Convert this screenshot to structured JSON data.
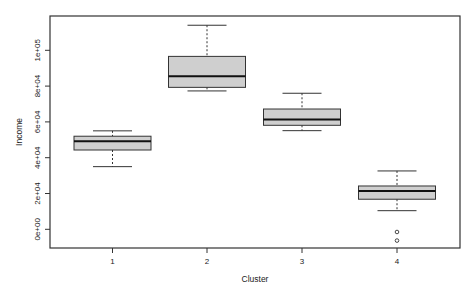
{
  "chart_data": {
    "type": "boxplot",
    "title": "",
    "xlabel": "Cluster",
    "ylabel": "Income",
    "categories": [
      "1",
      "2",
      "3",
      "4"
    ],
    "y_ticks": [
      {
        "value": 0,
        "label": "0e+00"
      },
      {
        "value": 20000,
        "label": "2e+04"
      },
      {
        "value": 40000,
        "label": "4e+04"
      },
      {
        "value": 60000,
        "label": "6e+04"
      },
      {
        "value": 80000,
        "label": "8e+04"
      },
      {
        "value": 100000,
        "label": "1e+05"
      }
    ],
    "ylim": [
      -10000,
      129000
    ],
    "grid": false,
    "legend": null,
    "box_fill": "#cfcfcf",
    "series": [
      {
        "name": "1",
        "lower_whisker": 35000,
        "q1": 44300,
        "median": 49200,
        "q3": 52000,
        "upper_whisker": 55000,
        "outliers": []
      },
      {
        "name": "2",
        "lower_whisker": 77300,
        "q1": 79300,
        "median": 85500,
        "q3": 96600,
        "upper_whisker": 114000,
        "outliers": []
      },
      {
        "name": "3",
        "lower_whisker": 55100,
        "q1": 58100,
        "median": 61300,
        "q3": 67200,
        "upper_whisker": 76000,
        "outliers": []
      },
      {
        "name": "4",
        "lower_whisker": 10400,
        "q1": 16800,
        "median": 21400,
        "q3": 24200,
        "upper_whisker": 32600,
        "outliers": [
          -1500,
          -6300
        ]
      }
    ]
  }
}
